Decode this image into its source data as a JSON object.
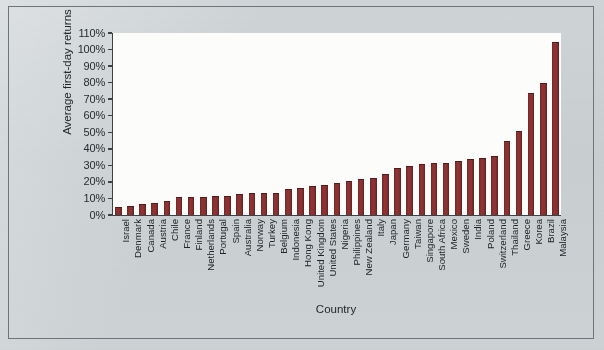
{
  "chart_data": {
    "type": "bar",
    "title": "",
    "xlabel": "Country",
    "ylabel": "Average first-day returns",
    "ylim": [
      0,
      110
    ],
    "ytick_labels": [
      "110%",
      "100%",
      "90%",
      "80%",
      "70%",
      "60%",
      "50%",
      "40%",
      "30%",
      "20%",
      "10%",
      "0%"
    ],
    "ytick_values": [
      110,
      100,
      90,
      80,
      70,
      60,
      50,
      40,
      30,
      20,
      10,
      0
    ],
    "grid": false,
    "legend": "none",
    "bar_color": "#8a3131",
    "categories": [
      "Israel",
      "Denmark",
      "Canada",
      "Austria",
      "Chile",
      "France",
      "Finland",
      "Netherlands",
      "Portugal",
      "Spain",
      "Australia",
      "Norway",
      "Turkey",
      "Belgium",
      "Indonesia",
      "Hong Kong",
      "United Kingdom",
      "United States",
      "Nigeria",
      "Philippines",
      "New Zealand",
      "Italy",
      "Japan",
      "Germany",
      "Taiwan",
      "Singapore",
      "South Africa",
      "Mexico",
      "Sweden",
      "India",
      "Poland",
      "Switzerland",
      "Thailand",
      "Greece",
      "Korea",
      "Brazil",
      "Malaysia"
    ],
    "values": [
      4,
      5,
      6,
      6.5,
      8,
      10,
      10,
      10,
      11,
      11,
      12,
      12.5,
      13,
      13,
      15,
      16,
      17,
      17.5,
      19,
      20,
      21,
      22,
      24,
      28,
      29,
      30,
      31,
      31,
      32,
      33,
      34,
      35,
      44,
      50,
      73,
      79,
      104
    ]
  }
}
